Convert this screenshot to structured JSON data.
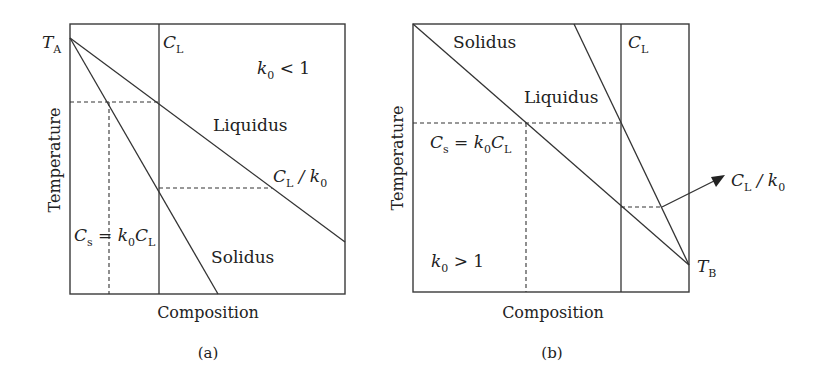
{
  "panel_a": {
    "caption": "(a)",
    "x_axis": "Composition",
    "y_axis": "Temperature",
    "condition": {
      "k": "k",
      "sub": "0",
      "rest": " < 1"
    },
    "melting_point": {
      "T": "T",
      "sub": "A"
    },
    "cl_label": {
      "C": "C",
      "sub": "L"
    },
    "liquidus": "Liquidus",
    "solidus": "Solidus",
    "cl_over_k0": {
      "C": "C",
      "sub1": "L",
      "mid": " / k",
      "sub2": "0"
    },
    "cs_eq": {
      "C": "C",
      "sub1": "s",
      "eq": " = k",
      "sub2": "0",
      "C2": "C",
      "sub3": "L"
    }
  },
  "panel_b": {
    "caption": "(b)",
    "x_axis": "Composition",
    "y_axis": "Temperature",
    "condition": {
      "k": "k",
      "sub": "0",
      "rest": " > 1"
    },
    "melting_point": {
      "T": "T",
      "sub": "B"
    },
    "cl_label": {
      "C": "C",
      "sub": "L"
    },
    "liquidus": "Liquidus",
    "solidus": "Solidus",
    "cl_over_k0": {
      "C": "C",
      "sub1": "L",
      "mid": " / k",
      "sub2": "0"
    },
    "cs_eq": {
      "C": "C",
      "sub1": "s",
      "eq": " = k",
      "sub2": "0",
      "C2": "C",
      "sub3": "L"
    }
  }
}
